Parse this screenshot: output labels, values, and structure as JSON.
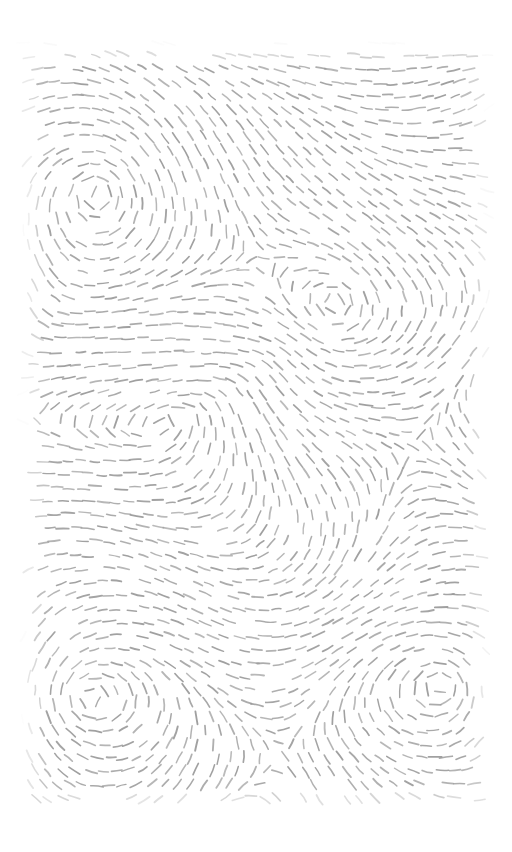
{
  "artwork": {
    "title": "Dashed Flow Field with Vortices",
    "type": "generative-flow-field",
    "canvas": {
      "width": 512,
      "height": 852,
      "background_color": "#ffffff"
    },
    "pattern_region": {
      "left": 22,
      "top": 42,
      "right": 490,
      "bottom": 810
    },
    "stroke": {
      "color": "#9a9a9a",
      "width": 1.6,
      "dash_length": 11,
      "linecap": "round",
      "opacity": 0.95
    },
    "grid": {
      "spacing_x": 13.5,
      "spacing_y": 13.5,
      "jitter": 2.2
    },
    "vortices": [
      {
        "name": "vortex-top-left",
        "x": 97,
        "y": 192,
        "strength": 1.0,
        "falloff": 150
      },
      {
        "name": "vortex-center",
        "x": 340,
        "y": 300,
        "strength": 0.95,
        "falloff": 150
      },
      {
        "name": "vortex-bottom-left",
        "x": 88,
        "y": 700,
        "strength": 1.0,
        "falloff": 155
      },
      {
        "name": "vortex-bottom-right",
        "x": 443,
        "y": 685,
        "strength": 0.95,
        "falloff": 150
      }
    ],
    "flow_noise": {
      "scale_a": 0.0105,
      "scale_b": 0.0071,
      "amplitude_a": 1.15,
      "amplitude_b": 0.72
    },
    "edge_fade": {
      "margin": 26,
      "enabled": true
    }
  },
  "chart_data": {
    "type": "scatter",
    "xlabel": "",
    "ylabel": "",
    "xlim": [
      0,
      512
    ],
    "ylim": [
      0,
      852
    ],
    "grid": false,
    "legend": null,
    "annotations": [],
    "series": [
      {
        "name": "vortex-centers",
        "x": [
          97,
          340,
          88,
          443
        ],
        "y": [
          192,
          300,
          700,
          685
        ],
        "labels": [
          "vortex-top-left",
          "vortex-center",
          "vortex-bottom-left",
          "vortex-bottom-right"
        ]
      }
    ]
  }
}
